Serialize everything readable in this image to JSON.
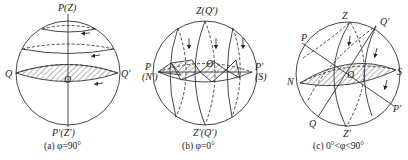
{
  "figure": {
    "panels": [
      {
        "id": "a",
        "caption": "(a) φ=90°",
        "labels": {
          "top": "P(Z)",
          "bottom": "P′(Z′)",
          "left": "Q",
          "right": "Q′",
          "center": "O"
        }
      },
      {
        "id": "b",
        "caption": "(b) φ=0°",
        "labels": {
          "top": "Z(Q′)",
          "bottom": "Z′(Q′)",
          "left_top": "P",
          "left_bottom": "(N′)",
          "right_top": "P′",
          "right_bottom": "(S)",
          "center": "O"
        }
      },
      {
        "id": "c",
        "caption": "(c) 0°<φ<90°",
        "labels": {
          "z": "Z",
          "q_prime": "Q′",
          "p": "P",
          "n": "N",
          "s": "S",
          "o": "O",
          "p_prime": "P′",
          "q": "Q",
          "z_prime": "Z′"
        }
      }
    ],
    "colors": {
      "stroke": "#333333",
      "hatch": "#444444",
      "background": "#ffffff"
    }
  }
}
